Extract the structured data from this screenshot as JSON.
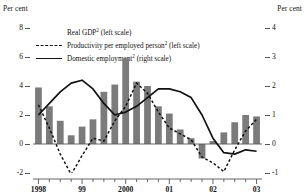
{
  "axis_unit_left": "Per cent",
  "axis_unit_right": "Per cent",
  "legend": [
    {
      "key": "bar",
      "marker": "bar-swatch",
      "label": "Real GDP² (left scale)"
    },
    {
      "key": "dash",
      "marker": "dashed-line",
      "label": "Productivity per employed person² (left scale)"
    },
    {
      "key": "line",
      "marker": "solid-line",
      "label": "Domestic employment² (right scale)"
    }
  ],
  "chart_data": {
    "type": "bar",
    "title": "",
    "subtitle": "",
    "xlabel": "",
    "ylabel": "Per cent",
    "y2label": "Per cent",
    "grid": false,
    "legend_position": "top-left",
    "ylim": [
      -2,
      8
    ],
    "y2lim": [
      -1,
      4
    ],
    "yticks": [
      -2,
      0,
      2,
      4,
      6,
      8
    ],
    "y2ticks": [
      -1,
      0,
      1,
      2,
      3,
      4
    ],
    "xlim": [
      "1998Q1",
      "2003Q1"
    ],
    "xtick_labels": [
      "1998",
      "99",
      "2000",
      "01",
      "02",
      "03"
    ],
    "xtick_positions": [
      "1998Q1",
      "1999Q1",
      "2000Q1",
      "2001Q1",
      "2002Q1",
      "2003Q1"
    ],
    "minor_ticks": "quarterly",
    "categories": [
      "1998Q1",
      "1998Q2",
      "1998Q3",
      "1998Q4",
      "1999Q1",
      "1999Q2",
      "1999Q3",
      "1999Q4",
      "2000Q1",
      "2000Q2",
      "2000Q3",
      "2000Q4",
      "2001Q1",
      "2001Q2",
      "2001Q3",
      "2001Q4",
      "2002Q1",
      "2002Q2",
      "2002Q3",
      "2002Q4",
      "2003Q1"
    ],
    "series": [
      {
        "name": "Real GDP² (left scale)",
        "type": "bar",
        "axis": "left",
        "color": "#7b7b7b",
        "values": [
          3.9,
          2.6,
          1.6,
          0.6,
          1.2,
          1.7,
          3.6,
          4.1,
          5.9,
          4.3,
          4.0,
          2.6,
          2.1,
          1.0,
          0.4,
          -1.0,
          0.2,
          0.8,
          1.5,
          2.0,
          1.9
        ]
      },
      {
        "name": "Productivity per employed person² (left scale)",
        "type": "line",
        "style": "dashed",
        "axis": "left",
        "color": "#111111",
        "values": [
          2.7,
          1.1,
          -0.7,
          -2.1,
          -0.8,
          0.4,
          0.2,
          1.6,
          2.6,
          4.2,
          3.5,
          2.2,
          1.1,
          0.7,
          0.3,
          -0.9,
          -1.3,
          -1.9,
          -0.4,
          0.9,
          1.7
        ]
      },
      {
        "name": "Domestic employment² (right scale)",
        "type": "line",
        "style": "solid",
        "axis": "right",
        "color": "#111111",
        "values": [
          1.0,
          1.4,
          1.8,
          2.1,
          2.2,
          1.9,
          1.4,
          1.0,
          1.1,
          1.3,
          1.6,
          1.9,
          1.9,
          1.8,
          1.6,
          1.0,
          0.2,
          -0.3,
          -0.35,
          -0.2,
          -0.25
        ]
      }
    ]
  }
}
